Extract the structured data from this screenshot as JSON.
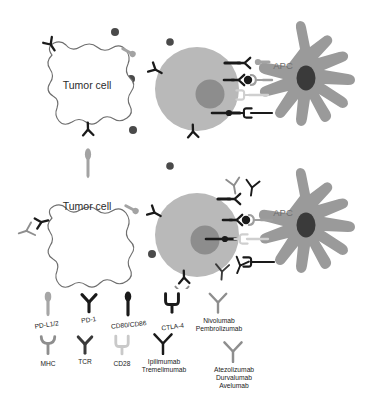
{
  "figure": {
    "panels": [
      {
        "id": "top",
        "name": "checkpoint-engagement",
        "cells": [
          {
            "type": "tumor-cell",
            "label": "Tumor cell"
          },
          {
            "type": "t-cell",
            "label": ""
          },
          {
            "type": "apc",
            "label": "APC"
          }
        ]
      },
      {
        "id": "bottom",
        "name": "checkpoint-blockade",
        "cells": [
          {
            "type": "tumor-cell",
            "label": "Tumor cell"
          },
          {
            "type": "t-cell",
            "label": ""
          },
          {
            "type": "apc",
            "label": "APC"
          }
        ]
      }
    ],
    "cell_labels": {
      "tumor": "Tumor cell",
      "apc": "APC"
    }
  },
  "legend": {
    "row1": [
      {
        "key": "pdl1",
        "label": "PD-L1/2",
        "glyph": "lollipop",
        "color": "#a6a6a6"
      },
      {
        "key": "pd1",
        "label": "PD-1",
        "glyph": "y-receptor",
        "color": "#1a1a1a"
      },
      {
        "key": "cd80",
        "label": "CD80/CD86",
        "glyph": "lollipop",
        "color": "#1a1a1a"
      },
      {
        "key": "ctla4",
        "label": "CTLA-4",
        "glyph": "u-receptor",
        "color": "#1a1a1a"
      },
      {
        "key": "nivo",
        "label": "Nivolumab\nPembrolizumab",
        "glyph": "antibody",
        "color": "#8e8e8e"
      }
    ],
    "row2": [
      {
        "key": "mhc",
        "label": "MHC",
        "glyph": "t-receptor",
        "color": "#8e8e8e"
      },
      {
        "key": "tcr",
        "label": "TCR",
        "glyph": "y-receptor",
        "color": "#3a3a3a"
      },
      {
        "key": "cd28",
        "label": "CD28",
        "glyph": "u-receptor",
        "color": "#c9c9c9"
      },
      {
        "key": "ipi",
        "label": "Ipilimumab\nTremelimumab",
        "glyph": "antibody",
        "color": "#1a1a1a"
      },
      {
        "key": "atezo",
        "label": "Atezolizumab\nDurvalumab\nAvelumab",
        "glyph": "antibody",
        "color": "#8e8e8e"
      }
    ],
    "labels": {
      "pdl1": "PD-L1/2",
      "pd1": "PD-1",
      "cd80": "CD80/CD86",
      "ctla4": "CTLA-4",
      "nivolumab": "Nivolumab",
      "pembrolizumab": "Pembrolizumab",
      "mhc": "MHC",
      "tcr": "TCR",
      "cd28": "CD28",
      "ipilimumab": "Ipilimumab",
      "tremelimumab": "Tremelimumab",
      "atezolizumab": "Atezolizumab",
      "durvalumab": "Durvalumab",
      "avelumab": "Avelumab"
    }
  },
  "colors": {
    "tumor_fill": "#ffffff",
    "tumor_stroke": "#6e6e6e",
    "tcell_fill": "#b9b9b9",
    "tcell_nucleus": "#8d8d8d",
    "apc_fill": "#9a9a9a",
    "apc_nucleus": "#3a3a3a",
    "dark_receptor": "#1a1a1a",
    "gray_receptor": "#9e9e9e",
    "light_receptor": "#cccccc",
    "free_dot": "#4a4a4a",
    "background": "#ffffff"
  }
}
